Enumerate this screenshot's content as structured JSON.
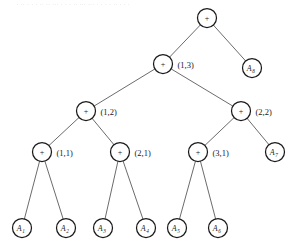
{
  "figure": {
    "kind": "binary-tree-diagram",
    "background_color": "#ffffff",
    "stroke_color": "#1a1a1a",
    "edge_color": "#2b2b2b",
    "width": 297,
    "height": 249,
    "top_artifact_text": "        . ..  .  .    . .. .. ... . .  .      .. ... ... .    .  .  .   ..  .   . .",
    "node_radius_internal": 9,
    "node_radius_leaf": 9
  },
  "nodes": [
    {
      "id": "root",
      "label": "+",
      "tag": "",
      "cx": 207,
      "cy": 18,
      "r": 9.5,
      "type": "operator"
    },
    {
      "id": "n13",
      "label": "+",
      "tag": "(1,3)",
      "cx": 163,
      "cy": 64,
      "r": 9.5,
      "type": "operator"
    },
    {
      "id": "a8",
      "label": "A",
      "sub": "8",
      "tag": "",
      "cx": 252,
      "cy": 68,
      "r": 9.5,
      "type": "leaf"
    },
    {
      "id": "n12",
      "label": "+",
      "tag": "(1,2)",
      "cx": 86,
      "cy": 111,
      "r": 9.5,
      "type": "operator"
    },
    {
      "id": "n22",
      "label": "+",
      "tag": "(2,2)",
      "cx": 241,
      "cy": 111,
      "r": 9.5,
      "type": "operator"
    },
    {
      "id": "n11",
      "label": "+",
      "tag": "(1,1)",
      "cx": 42,
      "cy": 152,
      "r": 9.5,
      "type": "operator"
    },
    {
      "id": "n21",
      "label": "+",
      "tag": "(2,1)",
      "cx": 120,
      "cy": 152,
      "r": 9.5,
      "type": "operator"
    },
    {
      "id": "n31",
      "label": "+",
      "tag": "(3,1)",
      "cx": 198,
      "cy": 152,
      "r": 9.5,
      "type": "operator"
    },
    {
      "id": "a7",
      "label": "A",
      "sub": "7",
      "tag": "",
      "cx": 275,
      "cy": 152,
      "r": 9.5,
      "type": "leaf"
    },
    {
      "id": "a1",
      "label": "A",
      "sub": "1",
      "tag": "",
      "cx": 22,
      "cy": 228,
      "r": 9.5,
      "type": "leaf"
    },
    {
      "id": "a2",
      "label": "A",
      "sub": "2",
      "tag": "",
      "cx": 66,
      "cy": 228,
      "r": 9.5,
      "type": "leaf"
    },
    {
      "id": "a3",
      "label": "A",
      "sub": "3",
      "tag": "",
      "cx": 103,
      "cy": 228,
      "r": 9.5,
      "type": "leaf"
    },
    {
      "id": "a4",
      "label": "A",
      "sub": "4",
      "tag": "",
      "cx": 146,
      "cy": 228,
      "r": 9.5,
      "type": "leaf"
    },
    {
      "id": "a5",
      "label": "A",
      "sub": "5",
      "tag": "",
      "cx": 177,
      "cy": 228,
      "r": 9.5,
      "type": "leaf"
    },
    {
      "id": "a6",
      "label": "A",
      "sub": "6",
      "tag": "",
      "cx": 218,
      "cy": 228,
      "r": 9.5,
      "type": "leaf"
    }
  ],
  "edges": [
    {
      "from": "root",
      "to": "n13"
    },
    {
      "from": "root",
      "to": "a8"
    },
    {
      "from": "n13",
      "to": "n12"
    },
    {
      "from": "n13",
      "to": "n22"
    },
    {
      "from": "n12",
      "to": "n11"
    },
    {
      "from": "n12",
      "to": "n21"
    },
    {
      "from": "n22",
      "to": "n31"
    },
    {
      "from": "n22",
      "to": "a7"
    },
    {
      "from": "n11",
      "to": "a1"
    },
    {
      "from": "n11",
      "to": "a2"
    },
    {
      "from": "n21",
      "to": "a3"
    },
    {
      "from": "n21",
      "to": "a4"
    },
    {
      "from": "n31",
      "to": "a5"
    },
    {
      "from": "n31",
      "to": "a6"
    }
  ],
  "chart_data": {
    "type": "diagram",
    "title": "",
    "leaf_labels": [
      "A1",
      "A2",
      "A3",
      "A4",
      "A5",
      "A6",
      "A7",
      "A8"
    ],
    "internal_tags": [
      "(1,3)",
      "(1,2)",
      "(2,2)",
      "(1,1)",
      "(2,1)",
      "(3,1)"
    ],
    "operator_symbol": "+",
    "depth": 5,
    "node_count": 15
  }
}
